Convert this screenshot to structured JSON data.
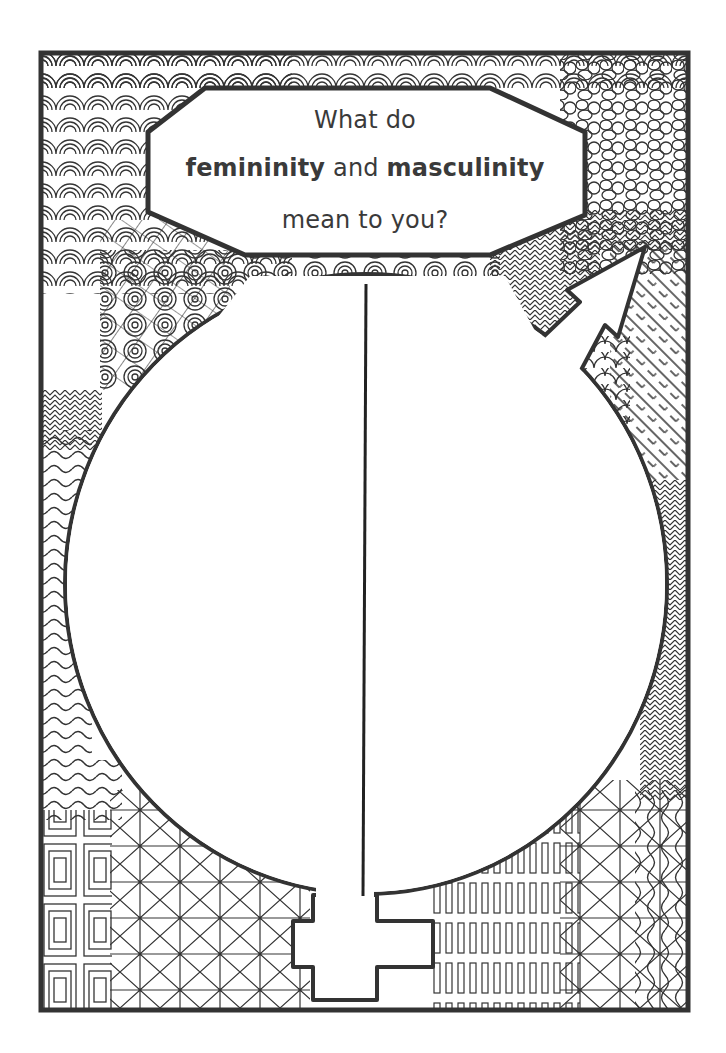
{
  "worksheet": {
    "prompt": {
      "line1": "What do",
      "line2_bold_a": "femininity",
      "line2_mid": " and ",
      "line2_bold_b": "masculinity",
      "line3": "mean to you?"
    },
    "symbols": [
      "female-symbol-cross",
      "male-symbol-arrow"
    ],
    "writing_areas": [
      "left-half",
      "right-half"
    ],
    "colors": {
      "ink": "#333333",
      "paper": "#ffffff",
      "text": "#3a3a3a"
    }
  }
}
